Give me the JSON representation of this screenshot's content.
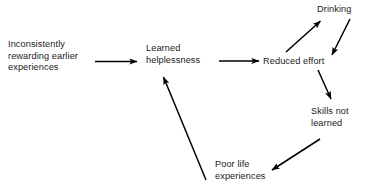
{
  "diagram": {
    "background_color": "#ffffff",
    "text_color": "#1a1a1a",
    "arrow_color": "#000000",
    "nodes": [
      {
        "id": "inconsistent",
        "label": "Inconsistently\nrewarding earlier\nexperiences"
      },
      {
        "id": "learned",
        "label": "Learned\nhelplessness"
      },
      {
        "id": "reduced",
        "label": "Reduced effort"
      },
      {
        "id": "drinking",
        "label": "Drinking"
      },
      {
        "id": "skills",
        "label": "Skills not\nlearned"
      },
      {
        "id": "poorlife",
        "label": "Poor life\nexperiences"
      }
    ],
    "edges": [
      {
        "id": "inconsistent-to-learned",
        "from": "Inconsistently rewarding earlier experiences",
        "to": "Learned helplessness",
        "style": "straight-horizontal"
      },
      {
        "id": "learned-to-reduced",
        "from": "Learned helplessness",
        "to": "Reduced effort",
        "style": "straight-horizontal"
      },
      {
        "id": "reduced-to-drinking",
        "from": "Reduced effort",
        "to": "Drinking",
        "style": "diagonal-up-right"
      },
      {
        "id": "drinking-to-skills",
        "from": "Drinking",
        "to": "Skills not learned",
        "style": "diagonal-down-right"
      },
      {
        "id": "reduced-to-skills",
        "from": "Reduced effort",
        "to": "Skills not learned",
        "style": "diagonal-down-right"
      },
      {
        "id": "skills-to-poorlife",
        "from": "Skills not learned",
        "to": "Poor life experiences",
        "style": "diagonal-down-left"
      },
      {
        "id": "poorlife-to-learned",
        "from": "Poor life experiences",
        "to": "Learned helplessness",
        "style": "diagonal-up-left"
      }
    ]
  }
}
